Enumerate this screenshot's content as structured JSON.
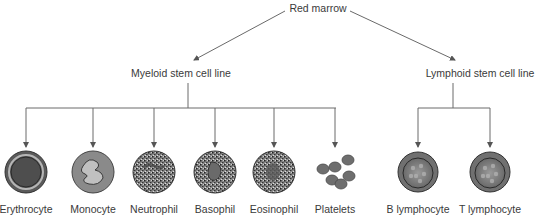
{
  "root": {
    "label": "Red marrow"
  },
  "branches": [
    {
      "label": "Myeloid stem cell line",
      "cells": [
        {
          "label": "Erythrocyte",
          "type": "erythrocyte"
        },
        {
          "label": "Monocyte",
          "type": "monocyte"
        },
        {
          "label": "Neutrophil",
          "type": "neutrophil"
        },
        {
          "label": "Basophil",
          "type": "basophil"
        },
        {
          "label": "Eosinophil",
          "type": "eosinophil"
        },
        {
          "label": "Platelets",
          "type": "platelets"
        }
      ]
    },
    {
      "label": "Lymphoid stem cell line",
      "cells": [
        {
          "label": "B lymphocyte",
          "type": "lymphocyte"
        },
        {
          "label": "T lymphocyte",
          "type": "lymphocyte"
        }
      ]
    }
  ],
  "colors": {
    "line": "#6a6a6a",
    "text": "#3a3a3a",
    "cell_dark": "#4a4a4a",
    "cell_mid": "#7a7a7a",
    "cell_light": "#a8a8a8"
  }
}
